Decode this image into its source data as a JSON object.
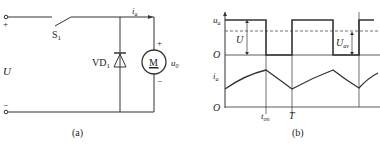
{
  "circuit": {
    "caption": "(a)",
    "switch": "S",
    "switch_sub": "1",
    "diode": "VD",
    "diode_sub": "1",
    "motor": "M",
    "voltage": "U",
    "current": "i",
    "current_sub": "a",
    "motor_voltage": "u",
    "motor_voltage_sub": "0",
    "plus": "+",
    "minus": "−"
  },
  "waveform": {
    "caption": "(b)",
    "u_axis": "u",
    "u_axis_sub": "a",
    "i_axis": "i",
    "i_axis_sub": "a",
    "origin": "O",
    "amplitude": "U",
    "average": "U",
    "average_sub": "av",
    "t_on": "t",
    "t_on_sub": "on",
    "period": "T"
  }
}
